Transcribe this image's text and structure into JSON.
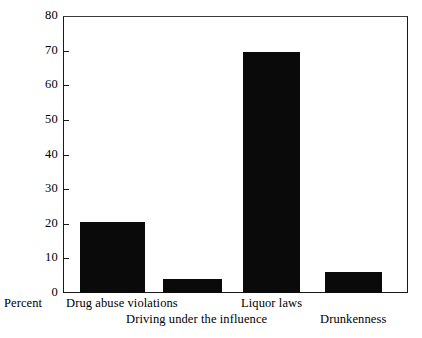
{
  "chart_data": {
    "type": "bar",
    "title": "",
    "subtitle": "",
    "xlabel": "",
    "ylabel": "Percent",
    "categories": [
      "Drug abuse violations",
      "Driving under the influence",
      "Liquor laws",
      "Drunkenness"
    ],
    "values": [
      20.5,
      4,
      69.5,
      6
    ],
    "ylim": [
      0,
      80
    ],
    "yticks": [
      0,
      10,
      20,
      30,
      40,
      50,
      60,
      70,
      80
    ],
    "ytick_labels": [
      "0",
      "10",
      "20",
      "30",
      "40",
      "50",
      "60",
      "70",
      "80"
    ],
    "grid": false,
    "legend": "none",
    "bar_color": "#0a0a0a",
    "axis_color": "#1a1a1a",
    "background_color": "#ffffff"
  },
  "axis": {
    "y_label": "Percent"
  },
  "x_labels": {
    "row1": [
      {
        "text": "Drug abuse violations"
      },
      {
        "text": "Liquor laws"
      }
    ],
    "row2": [
      {
        "text": "Driving under the influence"
      },
      {
        "text": "Drunkenness"
      }
    ]
  }
}
